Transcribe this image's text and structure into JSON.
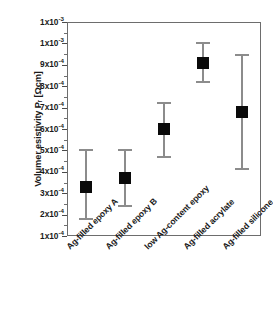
{
  "chart_data": {
    "type": "scatter",
    "title": "",
    "xlabel": "",
    "ylabel": "Volumer esistivity Pᵣ [Ωcm]",
    "ylim": [
      0.0001,
      0.0011
    ],
    "grid": false,
    "legend": "none",
    "categories": [
      "Ag-filled epoxy A",
      "Ag-filled epoxy B",
      "low Ag-content epoxy",
      "Ag-filled acrylate",
      "Ag-filled silicone"
    ],
    "values": [
      0.00033,
      0.00037,
      0.0006,
      0.00091,
      0.00068
    ],
    "error_low": [
      0.00018,
      0.00024,
      0.00047,
      0.00082,
      0.000415
    ],
    "error_high": [
      0.0005,
      0.0005,
      0.00072,
      0.001,
      0.000945
    ],
    "value_labels": [
      "3.3x10-4",
      "3.7x10-4",
      "6.0x10-4",
      "9.1x10-4",
      "6.8x10-4"
    ],
    "ytick_values": [
      0.0011,
      0.001,
      0.0009,
      0.0008,
      0.0007,
      0.0006,
      0.0005,
      0.0004,
      0.0003,
      0.0002,
      0.0001
    ],
    "ytick_labels": [
      {
        "mantissa": "1x10",
        "exponent": "-3"
      },
      {
        "mantissa": "1x10",
        "exponent": "-3"
      },
      {
        "mantissa": "9x10",
        "exponent": "-4"
      },
      {
        "mantissa": "8x10",
        "exponent": "-4"
      },
      {
        "mantissa": "7x10",
        "exponent": "-4"
      },
      {
        "mantissa": "6x10",
        "exponent": "-4"
      },
      {
        "mantissa": "5x10",
        "exponent": "-4"
      },
      {
        "mantissa": "4x10",
        "exponent": "-4"
      },
      {
        "mantissa": "3x10",
        "exponent": "-4"
      },
      {
        "mantissa": "2x10",
        "exponent": "-4"
      },
      {
        "mantissa": "1x10",
        "exponent": "-4"
      }
    ],
    "colors": {
      "marker": "#0a0a0a",
      "errorbar": "#8c8c8c",
      "frame": "#6d6d6d",
      "background": "#ffffff",
      "text": "#1a1a1a"
    }
  }
}
